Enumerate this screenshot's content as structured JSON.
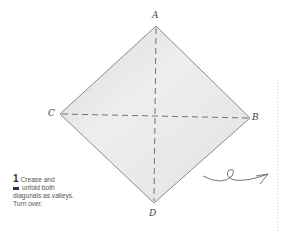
{
  "diagram": {
    "type": "origami-step",
    "labels": {
      "top": "A",
      "right": "B",
      "left": "C",
      "bottom": "D"
    },
    "step": {
      "number": "1",
      "line1": "Crease and",
      "line2": "unfold both",
      "line3": "diagonals as valleys.",
      "line4": "Turn over."
    },
    "colors": {
      "paper": "#e6e6e6",
      "edge": "#8a8a8a",
      "crease": "#666666"
    },
    "symbols": [
      "turn-over-arrow"
    ]
  }
}
